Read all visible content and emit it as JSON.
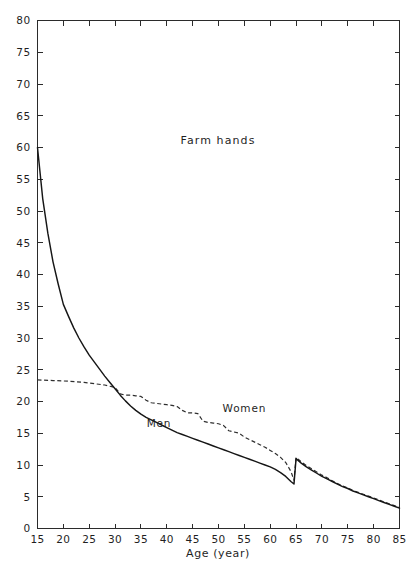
{
  "chart_data": {
    "type": "line",
    "title": "Farm hands",
    "xlabel": "Age (year)",
    "ylabel": "",
    "xlim": [
      15,
      85
    ],
    "ylim": [
      0,
      80
    ],
    "grid": false,
    "legend_position": "inline-annotation",
    "xticks": [
      15,
      20,
      25,
      30,
      35,
      40,
      45,
      50,
      55,
      60,
      65,
      70,
      75,
      80,
      85
    ],
    "xtick_labels": [
      "15",
      "20",
      "25",
      "30",
      "35",
      "40",
      "45",
      "50",
      "55",
      "60",
      "65",
      "70",
      "75",
      "80",
      "85"
    ],
    "yticks": [
      0,
      5,
      10,
      15,
      20,
      25,
      30,
      35,
      40,
      45,
      50,
      55,
      60,
      65,
      70,
      75,
      80
    ],
    "ytick_labels": [
      "0",
      "5",
      "10",
      "15",
      "20",
      "25",
      "30",
      "35",
      "40",
      "45",
      "50",
      "55",
      "60",
      "65",
      "70",
      "75",
      "80"
    ],
    "series": [
      {
        "name": "Men",
        "style": "solid",
        "color": "#161616",
        "label_x": 38.5,
        "label_y": 16.0,
        "x": [
          15,
          16,
          17,
          18,
          19,
          20,
          21,
          22,
          23,
          24,
          25,
          26,
          27,
          28,
          29,
          30,
          31,
          32,
          33,
          34,
          35,
          36,
          37,
          38,
          39,
          40,
          41,
          42,
          43,
          44,
          45,
          46,
          47,
          48,
          49,
          50,
          51,
          52,
          53,
          54,
          55,
          56,
          57,
          58,
          59,
          60,
          61,
          62,
          63,
          64,
          64.6,
          65,
          66,
          67,
          68,
          69,
          70,
          71,
          72,
          73,
          74,
          75,
          76,
          77,
          78,
          79,
          80,
          81,
          82,
          83,
          84,
          85
        ],
        "y": [
          60.0,
          52.0,
          46.5,
          42.0,
          38.5,
          35.3,
          33.4,
          31.6,
          30.0,
          28.6,
          27.3,
          26.2,
          25.1,
          24.0,
          23.0,
          22.0,
          21.0,
          20.1,
          19.3,
          18.6,
          18.0,
          17.5,
          17.1,
          16.7,
          16.3,
          15.9,
          15.5,
          15.1,
          14.8,
          14.5,
          14.2,
          13.9,
          13.6,
          13.3,
          13.0,
          12.7,
          12.4,
          12.1,
          11.8,
          11.5,
          11.2,
          10.9,
          10.6,
          10.3,
          10.0,
          9.7,
          9.3,
          8.8,
          8.2,
          7.4,
          7.0,
          11.0,
          10.3,
          9.7,
          9.2,
          8.7,
          8.2,
          7.8,
          7.4,
          7.0,
          6.6,
          6.3,
          5.9,
          5.6,
          5.3,
          5.0,
          4.7,
          4.4,
          4.1,
          3.8,
          3.5,
          3.2
        ]
      },
      {
        "name": "Women",
        "style": "dashed",
        "color": "#2e2e2e",
        "label_x": 55.0,
        "label_y": 18.3,
        "x": [
          15,
          18,
          21,
          24,
          26,
          28,
          29,
          30,
          31,
          32,
          33,
          34,
          35,
          36,
          37,
          38,
          39,
          40,
          41,
          42,
          43,
          44,
          45,
          46,
          47,
          48,
          49,
          50,
          51,
          52,
          53,
          54,
          55,
          56,
          57,
          58,
          59,
          60,
          61,
          62,
          63,
          64,
          64.6,
          65,
          66,
          67,
          68,
          69,
          70,
          71,
          72,
          73,
          74,
          75,
          76,
          77,
          78,
          79,
          80,
          81,
          82,
          83,
          84,
          85
        ],
        "y": [
          23.4,
          23.3,
          23.2,
          23.0,
          22.8,
          22.6,
          22.4,
          22.2,
          21.2,
          21.0,
          21.0,
          20.9,
          20.8,
          20.2,
          19.8,
          19.7,
          19.6,
          19.5,
          19.4,
          19.2,
          18.6,
          18.2,
          18.2,
          18.1,
          16.9,
          16.7,
          16.6,
          16.5,
          16.2,
          15.4,
          15.2,
          15.0,
          14.4,
          14.0,
          13.6,
          13.2,
          12.8,
          12.3,
          11.8,
          11.2,
          10.4,
          9.0,
          7.6,
          11.2,
          10.5,
          9.9,
          9.4,
          8.9,
          8.4,
          8.0,
          7.5,
          7.1,
          6.7,
          6.4,
          6.0,
          5.7,
          5.4,
          5.1,
          4.8,
          4.5,
          4.2,
          3.9,
          3.6,
          3.3
        ]
      }
    ]
  }
}
